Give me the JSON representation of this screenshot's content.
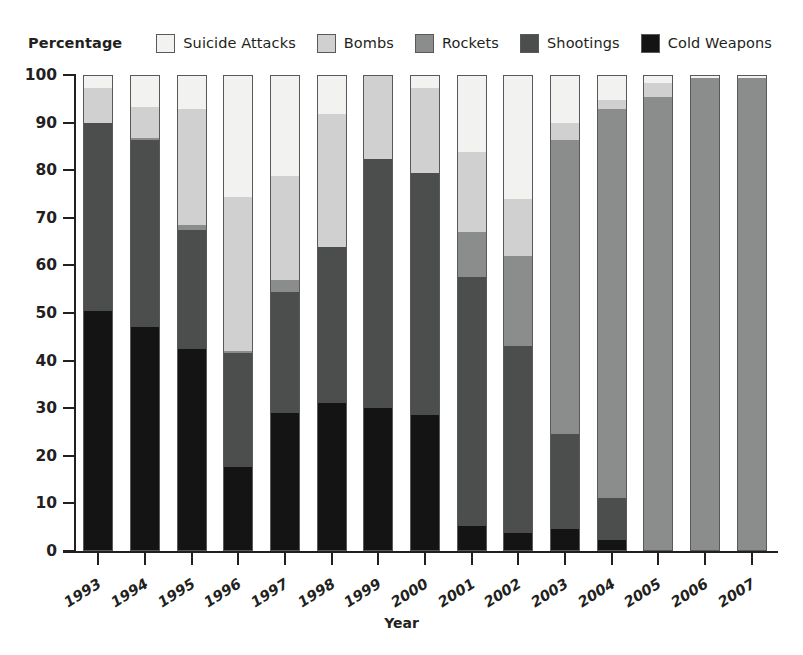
{
  "legend": {
    "title": "Percentage",
    "items": [
      {
        "label": "Suicide Attacks",
        "color": "#f2f2f1",
        "key": "suicide"
      },
      {
        "label": "Bombs",
        "color": "#cfd0cf",
        "key": "bombs"
      },
      {
        "label": "Rockets",
        "color": "#8b8c8c",
        "key": "rockets"
      },
      {
        "label": "Shootings",
        "color": "#4c4d4d",
        "key": "shootings"
      },
      {
        "label": "Cold Weapons",
        "color": "#141414",
        "key": "cold"
      }
    ]
  },
  "axes": {
    "y_title": "Percentage",
    "x_title": "Year",
    "y_ticks": [
      0,
      10,
      20,
      30,
      40,
      50,
      60,
      70,
      80,
      90,
      100
    ],
    "ylim": [
      0,
      100
    ]
  },
  "chart_data": {
    "type": "bar",
    "title": "",
    "subtitle": "",
    "stacked": true,
    "stack_total": 100,
    "xlabel": "Year",
    "ylabel": "Percentage",
    "ylim": [
      0,
      100
    ],
    "yticks": [
      0,
      10,
      20,
      30,
      40,
      50,
      60,
      70,
      80,
      90,
      100
    ],
    "grid": false,
    "legend_position": "top",
    "categories": [
      "1993",
      "1994",
      "1995",
      "1996",
      "1997",
      "1998",
      "1999",
      "2000",
      "2001",
      "2002",
      "2003",
      "2004",
      "2005",
      "2006",
      "2007"
    ],
    "series": [
      {
        "name": "Cold Weapons",
        "color": "#141414",
        "values": [
          50.5,
          47.0,
          42.5,
          17.5,
          29.0,
          31.0,
          30.0,
          28.5,
          5.0,
          3.5,
          4.5,
          2.0,
          0.0,
          0.0,
          0.0
        ]
      },
      {
        "name": "Shootings",
        "color": "#4c4d4d",
        "values": [
          39.5,
          39.5,
          25.0,
          24.0,
          25.5,
          33.0,
          52.5,
          51.0,
          52.5,
          39.5,
          20.0,
          9.0,
          0.0,
          0.0,
          0.0
        ]
      },
      {
        "name": "Rockets",
        "color": "#8b8c8c",
        "values": [
          0.0,
          0.5,
          1.0,
          0.5,
          2.5,
          0.0,
          0.0,
          0.0,
          9.5,
          19.0,
          62.0,
          82.0,
          95.5,
          99.5,
          99.5
        ]
      },
      {
        "name": "Bombs",
        "color": "#cfd0cf",
        "values": [
          7.5,
          6.5,
          24.5,
          32.5,
          22.0,
          28.0,
          17.5,
          18.0,
          17.0,
          12.0,
          3.5,
          2.0,
          3.0,
          0.0,
          0.0
        ]
      },
      {
        "name": "Suicide Attacks",
        "color": "#f2f2f1",
        "values": [
          2.5,
          6.5,
          7.0,
          25.5,
          21.0,
          8.0,
          0.0,
          2.5,
          16.0,
          26.0,
          10.0,
          5.0,
          1.5,
          0.5,
          0.5
        ]
      }
    ],
    "cumulative_tops": {
      "1993": {
        "cold": 50.5,
        "shootings": 90.0,
        "rockets": 90.0,
        "bombs": 97.5,
        "suicide": 100
      },
      "1994": {
        "cold": 47.0,
        "shootings": 86.5,
        "rockets": 87.0,
        "bombs": 93.5,
        "suicide": 100
      },
      "1995": {
        "cold": 42.5,
        "shootings": 67.5,
        "rockets": 68.5,
        "bombs": 93.0,
        "suicide": 100
      },
      "1996": {
        "cold": 17.5,
        "shootings": 41.5,
        "rockets": 42.0,
        "bombs": 74.5,
        "suicide": 100
      },
      "1997": {
        "cold": 29.0,
        "shootings": 54.5,
        "rockets": 57.0,
        "bombs": 79.0,
        "suicide": 100
      },
      "1998": {
        "cold": 31.0,
        "shootings": 64.0,
        "rockets": 64.0,
        "bombs": 92.0,
        "suicide": 100
      },
      "1999": {
        "cold": 30.0,
        "shootings": 82.5,
        "rockets": 82.5,
        "bombs": 100.0,
        "suicide": 100
      },
      "2000": {
        "cold": 28.5,
        "shootings": 79.5,
        "rockets": 79.5,
        "bombs": 97.5,
        "suicide": 100
      },
      "2001": {
        "cold": 5.0,
        "shootings": 57.5,
        "rockets": 67.0,
        "bombs": 84.0,
        "suicide": 100
      },
      "2002": {
        "cold": 3.5,
        "shootings": 43.0,
        "rockets": 62.0,
        "bombs": 74.0,
        "suicide": 100
      },
      "2003": {
        "cold": 4.5,
        "shootings": 24.5,
        "rockets": 86.5,
        "bombs": 90.0,
        "suicide": 100
      },
      "2004": {
        "cold": 2.0,
        "shootings": 11.0,
        "rockets": 93.0,
        "bombs": 95.0,
        "suicide": 100
      },
      "2005": {
        "cold": 0.0,
        "shootings": 0.0,
        "rockets": 95.5,
        "bombs": 98.5,
        "suicide": 100
      },
      "2006": {
        "cold": 0.0,
        "shootings": 0.0,
        "rockets": 99.5,
        "bombs": 99.5,
        "suicide": 100
      },
      "2007": {
        "cold": 0.0,
        "shootings": 0.0,
        "rockets": 99.5,
        "bombs": 99.5,
        "suicide": 100
      }
    }
  }
}
